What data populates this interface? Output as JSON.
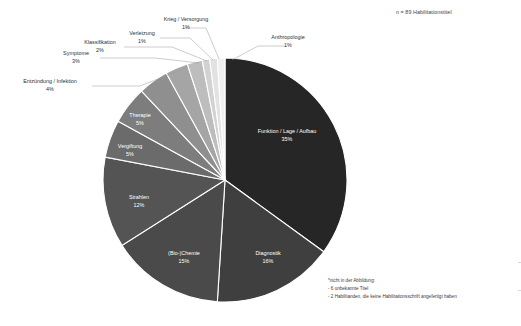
{
  "annotations": {
    "sample_size": "n = 89 Habilitationstitel",
    "footnote_title": "*nicht in der Abbildung:",
    "footnote_line1": "- 6 unbekannte Titel",
    "footnote_line2": "- 2 Habilitanden, die keine Habilitationsschrift angefertigt haben"
  },
  "chart_data": {
    "type": "pie",
    "title": "",
    "subtitle": "",
    "total_label": "n = 89 Habilitationstitel",
    "total": 89,
    "unit": "%",
    "legend_position": "labels-on-slices-and-leaders",
    "start_angle_deg": 0,
    "direction": "clockwise",
    "categories": [
      "Funktion / Lage / Aufbau",
      "Diagnostik",
      "(Bio-)Chemie",
      "Strahlen",
      "Vergiftung",
      "Therapie",
      "Entzündung / Infektion",
      "Symptome",
      "Klassifikation",
      "Verletzung",
      "Krieg / Versorgung",
      "Anthropologie"
    ],
    "values": [
      35,
      16,
      15,
      12,
      5,
      5,
      4,
      3,
      2,
      1,
      1,
      1
    ],
    "colors": [
      "#262626",
      "#3f3f3f",
      "#4a4a4a",
      "#545454",
      "#6b6b6b",
      "#7d7d7d",
      "#8f8f8f",
      "#a5a5a5",
      "#bdbdbd",
      "#d2d2d2",
      "#e2e2e2",
      "#f0f0f0"
    ],
    "slices": [
      {
        "label": "Funktion / Lage / Aufbau",
        "value": 35,
        "pct": "35%",
        "label_placement": "inside"
      },
      {
        "label": "Diagnostik",
        "value": 16,
        "pct": "16%",
        "label_placement": "inside"
      },
      {
        "label": "(Bio-)Chemie",
        "value": 15,
        "pct": "15%",
        "label_placement": "inside"
      },
      {
        "label": "Strahlen",
        "value": 12,
        "pct": "12%",
        "label_placement": "inside"
      },
      {
        "label": "Vergiftung",
        "value": 5,
        "pct": "5%",
        "label_placement": "inside"
      },
      {
        "label": "Therapie",
        "value": 5,
        "pct": "5%",
        "label_placement": "inside"
      },
      {
        "label": "Entzündung / Infektion",
        "value": 4,
        "pct": "4%",
        "label_placement": "outside"
      },
      {
        "label": "Symptome",
        "value": 3,
        "pct": "3%",
        "label_placement": "outside"
      },
      {
        "label": "Klassifikation",
        "value": 2,
        "pct": "2%",
        "label_placement": "outside"
      },
      {
        "label": "Verletzung",
        "value": 1,
        "pct": "1%",
        "label_placement": "outside"
      },
      {
        "label": "Krieg / Versorgung",
        "value": 1,
        "pct": "1%",
        "label_placement": "outside"
      },
      {
        "label": "Anthropologie",
        "value": 1,
        "pct": "1%",
        "label_placement": "outside"
      }
    ]
  },
  "labels": {
    "funktion": {
      "name": "Funktion / Lage / Aufbau",
      "pct": "35%"
    },
    "diagnostik": {
      "name": "Diagnostik",
      "pct": "16%"
    },
    "biochemie": {
      "name": "(Bio-)Chemie",
      "pct": "15%"
    },
    "strahlen": {
      "name": "Strahlen",
      "pct": "12%"
    },
    "vergiftung": {
      "name": "Vergiftung",
      "pct": "5%"
    },
    "therapie": {
      "name": "Therapie",
      "pct": "5%"
    },
    "entzuendung": {
      "name": "Entzündung / Infektion",
      "pct": "4%"
    },
    "symptome": {
      "name": "Symptome",
      "pct": "3%"
    },
    "klassifikation": {
      "name": "Klassifikation",
      "pct": "2%"
    },
    "verletzung": {
      "name": "Verletzung",
      "pct": "1%"
    },
    "krieg": {
      "name": "Krieg / Versorgung",
      "pct": "1%"
    },
    "anthropologie": {
      "name": "Anthropologie",
      "pct": "1%"
    }
  }
}
